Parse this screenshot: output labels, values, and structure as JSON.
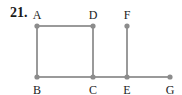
{
  "problem": {
    "number": "21."
  },
  "colors": {
    "edge": "#9a9a9a",
    "vertex": "#8c8c8c",
    "label": "#222222"
  },
  "vertices": [
    {
      "id": "A",
      "label": "A",
      "x": 37,
      "y": 26,
      "label_pos": "above"
    },
    {
      "id": "D",
      "label": "D",
      "x": 93,
      "y": 26,
      "label_pos": "above"
    },
    {
      "id": "F",
      "label": "F",
      "x": 127,
      "y": 26,
      "label_pos": "above"
    },
    {
      "id": "B",
      "label": "B",
      "x": 37,
      "y": 77,
      "label_pos": "below"
    },
    {
      "id": "C",
      "label": "C",
      "x": 93,
      "y": 77,
      "label_pos": "below"
    },
    {
      "id": "E",
      "label": "E",
      "x": 127,
      "y": 77,
      "label_pos": "below"
    },
    {
      "id": "G",
      "label": "G",
      "x": 170,
      "y": 77,
      "label_pos": "below"
    }
  ],
  "edges": [
    [
      "A",
      "D"
    ],
    [
      "A",
      "B"
    ],
    [
      "D",
      "C"
    ],
    [
      "B",
      "C"
    ],
    [
      "C",
      "E"
    ],
    [
      "E",
      "F"
    ],
    [
      "E",
      "G"
    ]
  ]
}
